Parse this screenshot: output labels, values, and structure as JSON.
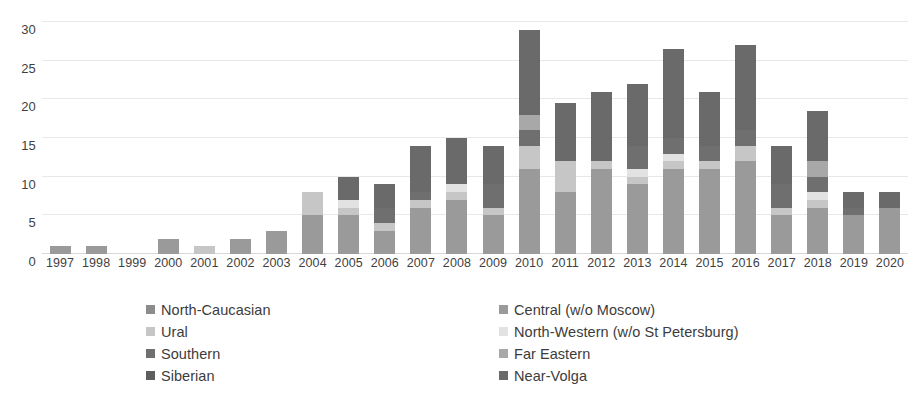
{
  "chart_data": {
    "type": "bar",
    "subtype": "stacked-bar",
    "title": "",
    "xlabel": "",
    "ylabel": "",
    "ylim": [
      0,
      30
    ],
    "yticks": [
      0,
      5,
      10,
      15,
      20,
      25,
      30
    ],
    "grid": true,
    "legend_position": "bottom",
    "categories": [
      "1997",
      "1998",
      "1999",
      "2000",
      "2001",
      "2002",
      "2003",
      "2004",
      "2005",
      "2006",
      "2007",
      "2008",
      "2009",
      "2010",
      "2011",
      "2012",
      "2013",
      "2014",
      "2015",
      "2016",
      "2017",
      "2018",
      "2019",
      "2020"
    ],
    "series": [
      {
        "name": "North-Caucasian",
        "color": "#8c8c8c",
        "values": [
          0,
          0,
          0,
          0,
          0,
          0,
          0,
          0,
          0,
          0,
          0,
          0,
          0,
          0,
          0,
          0,
          0,
          0,
          0,
          0,
          0,
          0,
          0,
          0
        ]
      },
      {
        "name": "Central (w/o Moscow)",
        "color": "#9a9a9a",
        "values": [
          1,
          1,
          0,
          2,
          0,
          2,
          3,
          5,
          5,
          3,
          6,
          7,
          5,
          11,
          8,
          11,
          9,
          11,
          11,
          12,
          5,
          6,
          5,
          6
        ]
      },
      {
        "name": "Ural",
        "color": "#c6c6c6",
        "values": [
          0,
          0,
          0,
          0,
          1,
          0,
          0,
          3,
          1,
          1,
          1,
          1,
          1,
          3,
          4,
          1,
          1,
          1,
          1,
          2,
          1,
          1,
          0,
          0
        ]
      },
      {
        "name": "North-Western (w/o St Petersburg)",
        "color": "#e2e2e2",
        "values": [
          0,
          0,
          0,
          0,
          0,
          0,
          0,
          0,
          1,
          0,
          0,
          1,
          0,
          0,
          0,
          0,
          1,
          1,
          0,
          0,
          0,
          1,
          0,
          0
        ]
      },
      {
        "name": "Southern",
        "color": "#6f6f6f",
        "values": [
          0,
          0,
          0,
          0,
          0,
          0,
          0,
          0,
          0,
          2,
          1,
          0,
          3,
          2,
          0,
          0,
          3,
          2,
          2,
          2,
          3,
          2,
          1,
          0
        ]
      },
      {
        "name": "Far Eastern",
        "color": "#a8a8a8",
        "values": [
          0,
          0,
          0,
          0,
          0,
          0,
          0,
          0,
          0,
          0,
          0,
          0,
          0,
          2,
          0,
          0,
          0,
          0,
          0,
          0,
          0,
          2,
          0,
          0
        ]
      },
      {
        "name": "Siberian",
        "color": "#5e5e5e",
        "values": [
          0,
          0,
          0,
          0,
          0,
          0,
          0,
          0,
          0,
          0,
          0,
          0,
          0,
          0,
          0,
          0,
          0,
          0,
          0,
          0,
          0,
          0,
          0,
          0
        ]
      },
      {
        "name": "Near-Volga",
        "color": "#6a6a6a",
        "values": [
          0,
          0,
          0,
          0,
          0,
          0,
          0,
          0,
          3,
          3,
          6,
          6,
          5,
          11,
          7.5,
          9,
          8,
          11.5,
          7,
          11,
          5,
          6.5,
          2,
          2
        ]
      }
    ],
    "totals": [
      1,
      1,
      0,
      2,
      1,
      2,
      3,
      8,
      10,
      9,
      14,
      15,
      14,
      29,
      19.5,
      21,
      22,
      26.5,
      21,
      27,
      14,
      18.5,
      8,
      8
    ]
  },
  "legend": {
    "columns": [
      {
        "items": [
          {
            "label": "North-Caucasian",
            "color": "#8c8c8c"
          },
          {
            "label": "Ural",
            "color": "#c6c6c6"
          },
          {
            "label": "Southern",
            "color": "#6f6f6f"
          },
          {
            "label": "Siberian",
            "color": "#5e5e5e"
          }
        ]
      },
      {
        "items": [
          {
            "label": "Central (w/o Moscow)",
            "color": "#9a9a9a"
          },
          {
            "label": "North-Western (w/o St Petersburg)",
            "color": "#e2e2e2"
          },
          {
            "label": "Far Eastern",
            "color": "#a8a8a8"
          },
          {
            "label": "Near-Volga",
            "color": "#6a6a6a"
          }
        ]
      }
    ]
  }
}
